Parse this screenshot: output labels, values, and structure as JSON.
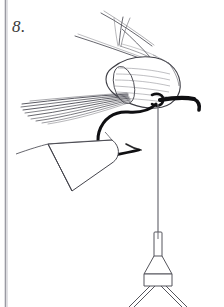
{
  "figure": {
    "step_number": "8.",
    "caption": "",
    "background_color": "#ffffff",
    "ink_color": "#1a1a1a",
    "line_color": "#555555",
    "border_color": "#8a8a93",
    "canvas": {
      "width": 224,
      "height": 307
    }
  },
  "parts": {
    "frame_border_left": "page-edge-rule",
    "hook": {
      "name": "hook",
      "eye_label": "hook-eye",
      "shank_label": "hook-shank",
      "bend_label": "hook-bend",
      "color": "#111111"
    },
    "hair_bundles": [
      {
        "name": "upper-wing-fibers",
        "label": "splayed hair tips upper"
      },
      {
        "name": "left-hackle-fibers",
        "label": "bundled hair fibers left"
      },
      {
        "name": "lower-wedge-bundle",
        "label": "tapered hair wedge lower left"
      },
      {
        "name": "spun-hair-cone",
        "label": "packed deer hair cone"
      }
    ],
    "thread": {
      "name": "tying-thread",
      "label": "thread hanging from hook"
    },
    "bobbin": {
      "name": "bobbin-holder",
      "tube_label": "bobbin-tube",
      "body_label": "bobbin-body",
      "legs_label": "bobbin-legs"
    }
  }
}
